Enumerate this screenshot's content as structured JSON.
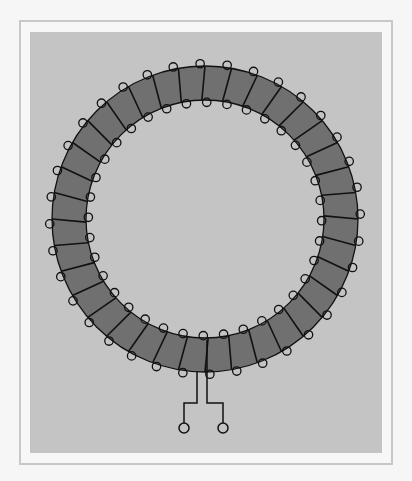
{
  "diagram": {
    "title": "",
    "colors": {
      "page_background": "#f6f6f6",
      "frame_border": "#c8c8c8",
      "frame_fill": "#f7f7f7",
      "panel_fill": "#c4c4c4",
      "core_fill": "#707070",
      "wire_stroke": "#111111"
    },
    "core": {
      "center_x": 205,
      "center_y": 219,
      "outer_radius": 153,
      "inner_radius": 119
    },
    "winding": {
      "turn_count": 36,
      "start_angle_deg": 90,
      "tilt_deg": 1.5,
      "loop_radius": 4.2,
      "loop_shift_deg": 1.8
    },
    "leads": [
      {
        "name": "lead-left",
        "points": [
          [
            197,
            372
          ],
          [
            197,
            403
          ],
          [
            184,
            403
          ],
          [
            184,
            423
          ]
        ],
        "terminal": {
          "cx": 184,
          "cy": 428,
          "r": 5
        }
      },
      {
        "name": "lead-right",
        "points": [
          [
            207,
            340
          ],
          [
            207,
            403
          ],
          [
            223,
            403
          ],
          [
            223,
            423
          ]
        ],
        "terminal": {
          "cx": 223,
          "cy": 428,
          "r": 5
        }
      }
    ]
  }
}
